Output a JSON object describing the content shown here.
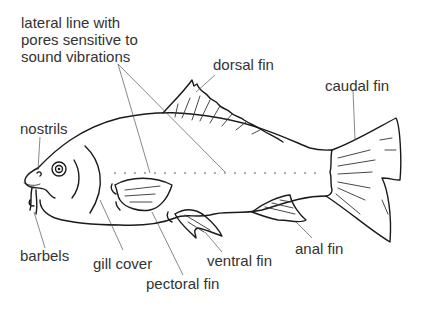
{
  "diagram": {
    "labels": {
      "lateral_line": [
        "lateral line with",
        "pores sensitive to",
        "sound vibrations"
      ],
      "dorsal_fin": "dorsal fin",
      "caudal_fin": "caudal fin",
      "nostrils": "nostrils",
      "barbels": "barbels",
      "gill_cover": "gill cover",
      "pectoral_fin": "pectoral fin",
      "ventral_fin": "ventral fin",
      "anal_fin": "anal fin"
    },
    "colors": {
      "line": "#1a1a1a",
      "text": "#333333",
      "background": "#ffffff"
    }
  }
}
